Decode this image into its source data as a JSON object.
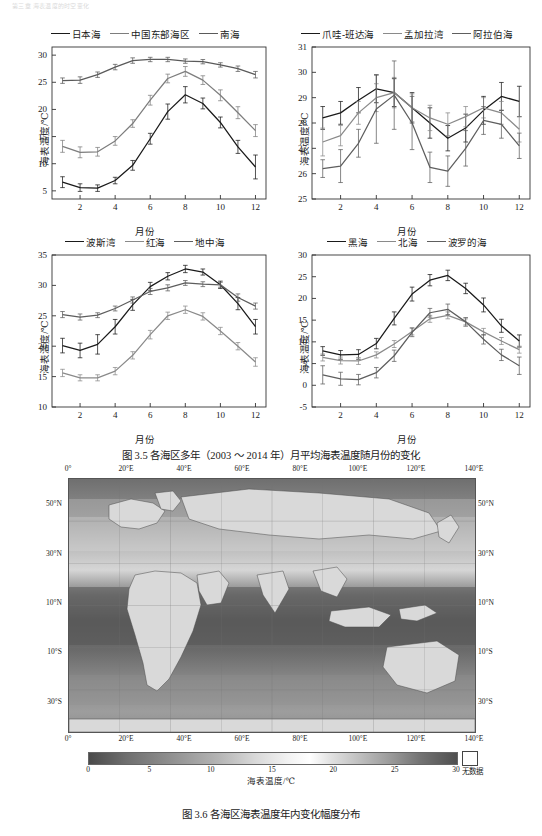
{
  "header": {
    "running_text": "第三章 海表温度的时空变化"
  },
  "figure_35": {
    "caption": "图 3.5   各海区多年（2003 ～ 2014 年）月平均海表温度随月份的变化",
    "axis": {
      "x_label": "月份",
      "y_label": "海表温度/℃"
    }
  },
  "figure_36": {
    "caption": "图 3.6   各海区海表温度年内变化幅度分布",
    "colorbar_title": "海表温度/℃",
    "colorbar_ticks": [
      "0",
      "5",
      "10",
      "15",
      "20",
      "25",
      "30"
    ],
    "nodata_label": "无数据",
    "lon_labels": [
      "0°",
      "20°E",
      "40°E",
      "60°E",
      "80°E",
      "100°E",
      "120°E",
      "140°E"
    ],
    "lat_labels": [
      "50°N",
      "30°N",
      "10°N",
      "10°S",
      "30°S"
    ]
  },
  "chart_data": [
    {
      "id": "panel-a",
      "type": "line",
      "title": "",
      "xlabel": "月份",
      "ylabel": "海表温度/℃",
      "x": [
        1,
        2,
        3,
        4,
        5,
        6,
        7,
        8,
        9,
        10,
        11,
        12
      ],
      "xlim": [
        0.4,
        12.6
      ],
      "ylim": [
        3.5,
        31.5
      ],
      "yticks": [
        5,
        10,
        15,
        20,
        25,
        30
      ],
      "xticks": [
        2,
        4,
        6,
        8,
        10,
        12
      ],
      "grid": false,
      "legend_position": "top",
      "series": [
        {
          "name": "日本海",
          "color": "#1a1a1a",
          "values": [
            6.6,
            5.6,
            5.5,
            6.9,
            9.7,
            14.6,
            19.6,
            22.7,
            21.1,
            17.6,
            13.1,
            9.4
          ],
          "err": [
            1.0,
            0.7,
            0.6,
            0.6,
            0.9,
            1.0,
            1.4,
            1.5,
            1.0,
            1.0,
            1.2,
            2.2
          ]
        },
        {
          "name": "中国东部海区",
          "color": "#7d7d7d",
          "values": [
            13.2,
            12.1,
            12.2,
            14.2,
            17.4,
            21.7,
            25.7,
            27.0,
            25.4,
            22.6,
            19.4,
            16.1
          ],
          "err": [
            1.1,
            1.0,
            0.8,
            0.8,
            0.7,
            0.9,
            0.8,
            0.9,
            0.8,
            1.0,
            1.1,
            1.1
          ]
        },
        {
          "name": "南海",
          "color": "#5a5a5a",
          "values": [
            25.3,
            25.4,
            26.4,
            27.8,
            29.0,
            29.2,
            29.2,
            28.9,
            28.8,
            28.2,
            27.5,
            26.4
          ],
          "err": [
            0.5,
            0.6,
            0.5,
            0.5,
            0.5,
            0.4,
            0.4,
            0.4,
            0.4,
            0.4,
            0.5,
            0.6
          ]
        }
      ]
    },
    {
      "id": "panel-b",
      "type": "line",
      "title": "",
      "xlabel": "月份",
      "ylabel": "海表温度/℃",
      "x": [
        1,
        2,
        3,
        4,
        5,
        6,
        7,
        8,
        9,
        10,
        11,
        12
      ],
      "xlim": [
        0.4,
        12.6
      ],
      "ylim": [
        25,
        31
      ],
      "yticks": [
        25,
        26,
        27,
        28,
        29,
        30,
        31
      ],
      "xticks": [
        2,
        4,
        6,
        8,
        10,
        12
      ],
      "grid": false,
      "legend_position": "top",
      "series": [
        {
          "name": "爪哇-班达海",
          "color": "#1a1a1a",
          "values": [
            28.2,
            28.4,
            28.9,
            29.35,
            29.2,
            28.6,
            28.0,
            27.4,
            27.8,
            28.5,
            29.05,
            28.85
          ],
          "err": [
            0.45,
            0.45,
            0.5,
            0.55,
            0.55,
            0.6,
            0.6,
            0.5,
            0.55,
            0.55,
            0.55,
            0.6
          ]
        },
        {
          "name": "孟加拉湾",
          "color": "#8a8a8a",
          "values": [
            27.25,
            27.5,
            28.4,
            29.0,
            29.2,
            28.6,
            28.2,
            27.95,
            28.25,
            28.6,
            28.4,
            27.75
          ],
          "err": [
            0.55,
            0.4,
            0.45,
            0.55,
            0.6,
            0.55,
            0.5,
            0.45,
            0.4,
            0.4,
            0.45,
            0.5
          ]
        },
        {
          "name": "阿拉伯海",
          "color": "#5e5e5e",
          "values": [
            26.2,
            26.3,
            27.2,
            28.55,
            29.1,
            28.0,
            26.25,
            26.1,
            27.0,
            28.1,
            27.95,
            27.1
          ],
          "err": [
            0.35,
            0.65,
            0.55,
            1.35,
            1.35,
            1.05,
            0.6,
            0.6,
            0.7,
            0.55,
            0.55,
            0.5
          ]
        }
      ]
    },
    {
      "id": "panel-c",
      "type": "line",
      "title": "",
      "xlabel": "月份",
      "ylabel": "海表温度/℃",
      "x": [
        1,
        2,
        3,
        4,
        5,
        6,
        7,
        8,
        9,
        10,
        11,
        12
      ],
      "xlim": [
        0.4,
        12.6
      ],
      "ylim": [
        10,
        35
      ],
      "yticks": [
        10,
        15,
        20,
        25,
        30,
        35
      ],
      "xticks": [
        2,
        4,
        6,
        8,
        10,
        12
      ],
      "grid": false,
      "legend_position": "top",
      "series": [
        {
          "name": "波斯湾",
          "color": "#1a1a1a",
          "values": [
            20.1,
            19.3,
            20.3,
            23.2,
            26.8,
            29.8,
            31.5,
            32.7,
            32.2,
            30.1,
            27.0,
            23.2
          ],
          "err": [
            1.2,
            1.2,
            1.6,
            1.2,
            0.9,
            0.7,
            0.6,
            0.6,
            0.5,
            0.6,
            1.0,
            1.2
          ]
        },
        {
          "name": "红海",
          "color": "#8a8a8a",
          "values": [
            15.6,
            14.8,
            14.8,
            15.9,
            18.5,
            21.9,
            25.0,
            26.0,
            24.9,
            22.5,
            20.0,
            17.4
          ],
          "err": [
            0.6,
            0.5,
            0.5,
            0.6,
            0.6,
            0.7,
            0.6,
            0.6,
            0.6,
            0.6,
            0.6,
            0.7
          ]
        },
        {
          "name": "地中海",
          "color": "#5e5e5e",
          "values": [
            25.2,
            24.8,
            25.1,
            26.2,
            27.6,
            29.0,
            29.6,
            30.4,
            30.2,
            30.1,
            28.0,
            26.6
          ],
          "err": [
            0.5,
            0.5,
            0.4,
            0.4,
            0.5,
            0.5,
            0.5,
            0.4,
            0.4,
            0.4,
            0.6,
            0.5
          ]
        }
      ]
    },
    {
      "id": "panel-d",
      "type": "line",
      "title": "",
      "xlabel": "月份",
      "ylabel": "海表温度/℃",
      "x": [
        1,
        2,
        3,
        4,
        5,
        6,
        7,
        8,
        9,
        10,
        11,
        12
      ],
      "xlim": [
        0.4,
        12.6
      ],
      "ylim": [
        -5,
        30
      ],
      "yticks": [
        -5,
        0,
        5,
        10,
        15,
        20,
        25,
        30
      ],
      "xticks": [
        2,
        4,
        6,
        8,
        10,
        12
      ],
      "grid": false,
      "legend_position": "top",
      "series": [
        {
          "name": "黑海",
          "color": "#1a1a1a",
          "values": [
            7.9,
            7.0,
            7.1,
            9.6,
            15.4,
            21.0,
            24.2,
            25.3,
            22.3,
            18.5,
            13.7,
            10.2
          ],
          "err": [
            1.0,
            1.0,
            1.1,
            1.2,
            1.5,
            1.6,
            1.3,
            1.2,
            1.2,
            1.6,
            1.5,
            1.4
          ]
        },
        {
          "name": "北海",
          "color": "#8a8a8a",
          "values": [
            6.4,
            5.7,
            5.6,
            7.0,
            9.5,
            12.4,
            15.3,
            16.1,
            14.6,
            12.3,
            10.2,
            8.2
          ],
          "err": [
            0.8,
            0.8,
            0.8,
            0.7,
            0.8,
            0.8,
            0.8,
            0.8,
            0.7,
            0.8,
            0.8,
            0.8
          ]
        },
        {
          "name": "波罗的海",
          "color": "#5e5e5e",
          "values": [
            2.4,
            1.5,
            1.3,
            2.9,
            6.8,
            12.2,
            16.7,
            17.5,
            14.6,
            10.6,
            7.0,
            4.5
          ],
          "err": [
            2.1,
            1.5,
            1.2,
            1.2,
            1.3,
            1.0,
            1.0,
            1.2,
            1.0,
            1.1,
            1.3,
            2.0
          ]
        }
      ]
    }
  ]
}
